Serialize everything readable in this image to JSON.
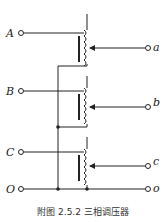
{
  "diagram": {
    "title": "附图 2.5.2   三相调压器",
    "inputs": [
      {
        "label": "A",
        "y": 33
      },
      {
        "label": "B",
        "y": 91
      },
      {
        "label": "C",
        "y": 152
      },
      {
        "label": "O",
        "y": 189
      }
    ],
    "outputs": [
      {
        "label": "a",
        "y": 48
      },
      {
        "label": "b",
        "y": 107
      },
      {
        "label": "c",
        "y": 166
      },
      {
        "label": "o",
        "y": 189
      }
    ],
    "stroke_color": "#222222"
  }
}
